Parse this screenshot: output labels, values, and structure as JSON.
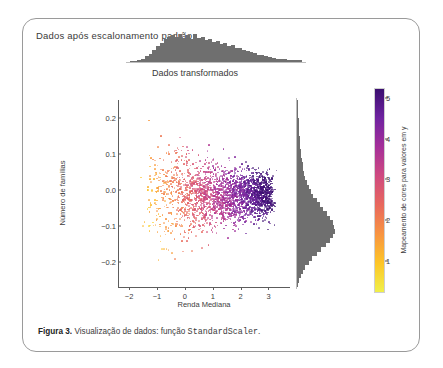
{
  "figure": {
    "title": "Dados após escalonamento padrão",
    "subtitle": "Dados transformados",
    "caption_label": "Figura 3.",
    "caption_text": "Visualização de dados: função",
    "caption_code": "StandardScaler",
    "caption_end": "."
  },
  "chart_data": {
    "type": "scatter",
    "title": "Dados após escalonamento padrão",
    "subtitle": "Dados transformados",
    "xlabel": "Renda Mediana",
    "ylabel": "Número de famílias",
    "xlim": [
      -2.4,
      3.7
    ],
    "ylim": [
      -0.27,
      0.25
    ],
    "xticks": [
      -2,
      -1,
      0,
      1,
      2,
      3
    ],
    "xticklabels": [
      "−2",
      "−1",
      "0",
      "1",
      "2",
      "3"
    ],
    "yticks": [
      0.2,
      0.1,
      0.0,
      -0.1,
      -0.2
    ],
    "yticklabels": [
      "0.2",
      "0.1",
      "0.0",
      "−0.1",
      "−0.2"
    ],
    "grid": false,
    "legend": false,
    "marker_size": 1.7,
    "n_points": 2600,
    "colormap": "plasma",
    "colormap_stops": [
      "#f0f04a",
      "#fdc527",
      "#f89441",
      "#e8685d",
      "#cf4a7f",
      "#a52f99",
      "#6f23a0",
      "#3b0f70"
    ],
    "colorbar": {
      "label": "Mapeamento de cores para valores em y",
      "ticks": [
        1,
        2,
        3,
        4,
        5
      ],
      "ticklabels": [
        "1",
        "2",
        "3",
        "4",
        "5"
      ],
      "vmin": 0.2,
      "vmax": 5.25,
      "position": "right",
      "color_variable": "y"
    },
    "marginal_top": {
      "type": "histogram",
      "variable": "Renda Mediana",
      "color": "#6f6f6f",
      "bins": 46,
      "counts": [
        2,
        3,
        5,
        8,
        13,
        19,
        27,
        36,
        44,
        52,
        57,
        62,
        58,
        64,
        55,
        61,
        52,
        63,
        56,
        58,
        50,
        53,
        46,
        49,
        41,
        44,
        36,
        38,
        31,
        33,
        27,
        25,
        22,
        20,
        17,
        15,
        13,
        11,
        9,
        8,
        7,
        6,
        5,
        5,
        4,
        4
      ]
    },
    "marginal_right": {
      "type": "histogram",
      "variable": "Número de famílias",
      "color": "#6f6f6f",
      "bins": 42,
      "counts": [
        1,
        1,
        2,
        2,
        3,
        3,
        4,
        4,
        5,
        5,
        6,
        7,
        8,
        9,
        11,
        12,
        14,
        16,
        19,
        22,
        26,
        31,
        37,
        43,
        50,
        57,
        63,
        68,
        71,
        72,
        69,
        63,
        55,
        46,
        37,
        29,
        22,
        16,
        11,
        7,
        4,
        2
      ]
    },
    "scatter_description": "Dense elongated point cloud; color encodes y-value via plasma colormap, yellow/orange at left (low x) shifting to pink/purple at right (high x)."
  }
}
